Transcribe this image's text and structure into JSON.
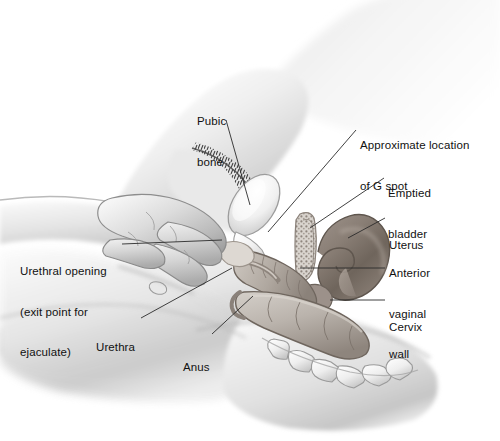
{
  "figure": {
    "width": 500,
    "height": 441,
    "background_color": "#ffffff",
    "style": "grayscale airbrush medical illustration"
  },
  "palette": {
    "text": "#111111",
    "leader_line": "#2b2b2b",
    "skin_light": "#f2f2f2",
    "skin_mid": "#d8d8d8",
    "skin_shadow": "#9a9a9a",
    "bone_light": "#f6f6f6",
    "organ_dark": "#7d7269",
    "organ_mid": "#a79a90",
    "rectum": "#b9b2aa",
    "hair_dark": "#3a3a3a"
  },
  "labels": [
    {
      "id": "pubic-bone",
      "lines": [
        "Pubic",
        "bone"
      ],
      "text": "Pubic bone",
      "side": "top",
      "x": 197,
      "y": 88,
      "leader": [
        [
          226,
          120
        ],
        [
          250,
          205
        ]
      ]
    },
    {
      "id": "g-spot",
      "lines": [
        "Approximate location",
        "of G spot"
      ],
      "text": "Approximate location of G spot",
      "side": "right",
      "x": 360,
      "y": 112,
      "leader": [
        [
          356,
          130
        ],
        [
          268,
          232
        ]
      ]
    },
    {
      "id": "emptied-bladder",
      "lines": [
        "Emptied",
        "bladder"
      ],
      "text": "Emptied bladder",
      "side": "right",
      "x": 388,
      "y": 160,
      "leader": [
        [
          384,
          178
        ],
        [
          310,
          228
        ]
      ]
    },
    {
      "id": "uterus",
      "lines": [
        "Uterus"
      ],
      "text": "Uterus",
      "side": "right",
      "x": 389,
      "y": 212,
      "leader": [
        [
          385,
          218
        ],
        [
          348,
          238
        ]
      ]
    },
    {
      "id": "anterior-vaginal-wall",
      "lines": [
        "Anterior",
        "vaginal",
        "wall"
      ],
      "text": "Anterior vaginal wall",
      "side": "right",
      "x": 389,
      "y": 240,
      "leader": [
        [
          385,
          268
        ],
        [
          300,
          268
        ]
      ]
    },
    {
      "id": "cervix",
      "lines": [
        "Cervix"
      ],
      "text": "Cervix",
      "side": "right",
      "x": 389,
      "y": 294,
      "leader": [
        [
          385,
          300
        ],
        [
          330,
          300
        ]
      ]
    },
    {
      "id": "urethral-opening",
      "lines": [
        "Urethral opening",
        "(exit point for",
        "ejaculate)"
      ],
      "text": "Urethral opening (exit point for ejaculate)",
      "side": "left",
      "x": 20,
      "y": 238,
      "leader": [
        [
          122,
          244
        ],
        [
          222,
          240
        ]
      ]
    },
    {
      "id": "urethra",
      "lines": [
        "Urethra"
      ],
      "text": "Urethra",
      "side": "left",
      "x": 96,
      "y": 314,
      "leader": [
        [
          141,
          318
        ],
        [
          232,
          268
        ]
      ]
    },
    {
      "id": "anus",
      "lines": [
        "Anus"
      ],
      "text": "Anus",
      "side": "left",
      "x": 183,
      "y": 334,
      "leader": [
        [
          212,
          334
        ],
        [
          253,
          296
        ]
      ]
    }
  ],
  "structures": [
    {
      "id": "pubic-bone",
      "name": "pubic bone",
      "shape": "oval cross-section",
      "tone": "light"
    },
    {
      "id": "bladder",
      "name": "emptied bladder",
      "shape": "collapsed folded sac",
      "tone": "stippled"
    },
    {
      "id": "uterus",
      "name": "uterus",
      "shape": "retroflexed hook",
      "tone": "dark brown-gray"
    },
    {
      "id": "cervix",
      "name": "cervix",
      "shape": "tapered neck",
      "tone": "mid"
    },
    {
      "id": "vaginal-canal",
      "name": "anterior vaginal wall",
      "shape": "ridged canal",
      "tone": "mid"
    },
    {
      "id": "rectum",
      "name": "rectum",
      "shape": "segmented tube",
      "tone": "mid"
    },
    {
      "id": "sacrum",
      "name": "sacrum and coccyx",
      "shape": "curved vertebral segments",
      "tone": "light bone"
    },
    {
      "id": "hand",
      "name": "hand with inserted fingers",
      "shape": "hand in profile",
      "tone": "skin"
    },
    {
      "id": "pubic-hair",
      "name": "pubic hair",
      "shape": "stippled arc",
      "tone": "dark"
    },
    {
      "id": "thigh",
      "name": "thigh",
      "shape": "large soft mass",
      "tone": "skin"
    },
    {
      "id": "buttock",
      "name": "buttock",
      "shape": "rounded mass",
      "tone": "skin"
    }
  ]
}
